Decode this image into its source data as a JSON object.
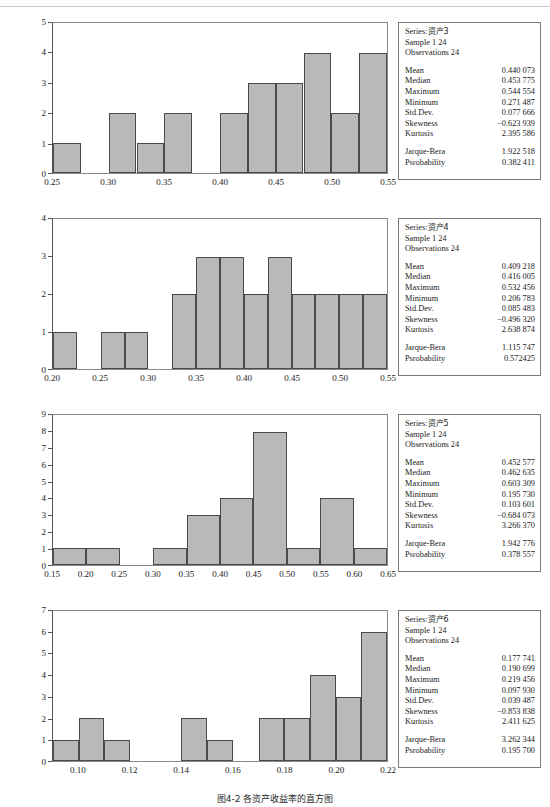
{
  "figure": {
    "caption": "图4-2  各资产收益率的直方图",
    "bar_fill": "#b9b9b9",
    "bar_stroke": "#4a4a4a",
    "frame_color": "#8a8a8a"
  },
  "stat_labels": {
    "series": "Series:",
    "sample": "Sample",
    "observations": "Observations",
    "mean": "Mean",
    "median": "Median",
    "maximum": "Maximum",
    "minimum": "Minimum",
    "std_dev": "Std.Dev.",
    "skewness": "Skewness",
    "kurtosis": "Kurtosis",
    "jarque_bera": "Jarque-Bera",
    "probability": "Psrobability"
  },
  "panels": [
    {
      "series_name": "资产3",
      "sample": "1 24",
      "observations": "24",
      "stats": {
        "mean": "0.440 073",
        "median": "0.453 775",
        "maximum": "0.544 554",
        "minimum": "0.271 487",
        "std_dev": "0.077 666",
        "skewness": "−0.623 939",
        "kurtosis": "2.395 586",
        "jarque_bera": "1.922 518",
        "probability": "0.382 411"
      },
      "chart_data": {
        "type": "bar",
        "title": "",
        "xlabel": "",
        "ylabel": "",
        "xlim": [
          0.25,
          0.55
        ],
        "ylim": [
          0,
          5
        ],
        "grid": false,
        "legend": "none",
        "xticks": [
          "0.25",
          "0.30",
          "0.35",
          "0.40",
          "0.45",
          "0.50",
          "0.55"
        ],
        "xtick_values": [
          0.25,
          0.3,
          0.35,
          0.4,
          0.45,
          0.5,
          0.55
        ],
        "yticks": [
          "0",
          "1",
          "2",
          "3",
          "4",
          "5"
        ],
        "ytick_values": [
          0,
          1,
          2,
          3,
          4,
          5
        ],
        "bin_width": 0.025,
        "bin_starts": [
          0.25,
          0.275,
          0.3,
          0.325,
          0.35,
          0.375,
          0.4,
          0.425,
          0.45,
          0.475,
          0.5,
          0.525
        ],
        "values": [
          1,
          0,
          2,
          1,
          2,
          0,
          2,
          3,
          3,
          4,
          2,
          4
        ]
      }
    },
    {
      "series_name": "资产4",
      "sample": "1 24",
      "observations": "24",
      "stats": {
        "mean": "0.409 218",
        "median": "0.416 005",
        "maximum": "0.532 456",
        "minimum": "0.206 783",
        "std_dev": "0.085 483",
        "skewness": "−0.496 320",
        "kurtosis": "2.638 874",
        "jarque_bera": "1.115 747",
        "probability": "0.572425"
      },
      "chart_data": {
        "type": "bar",
        "title": "",
        "xlabel": "",
        "ylabel": "",
        "xlim": [
          0.2,
          0.55
        ],
        "ylim": [
          0,
          4
        ],
        "grid": false,
        "legend": "none",
        "xticks": [
          "0.20",
          "0.25",
          "0.30",
          "0.35",
          "0.40",
          "0.45",
          "0.50",
          "0.55"
        ],
        "xtick_values": [
          0.2,
          0.25,
          0.3,
          0.35,
          0.4,
          0.45,
          0.5,
          0.55
        ],
        "yticks": [
          "0",
          "1",
          "2",
          "3",
          "4"
        ],
        "ytick_values": [
          0,
          1,
          2,
          3,
          4
        ],
        "bin_width": 0.025,
        "bin_starts": [
          0.2,
          0.225,
          0.25,
          0.275,
          0.3,
          0.325,
          0.35,
          0.375,
          0.4,
          0.425,
          0.45,
          0.475,
          0.5,
          0.525
        ],
        "values": [
          1,
          0,
          1,
          1,
          0,
          2,
          3,
          3,
          2,
          3,
          2,
          2,
          2,
          2
        ]
      }
    },
    {
      "series_name": "资产5",
      "sample": "1 24",
      "observations": "24",
      "stats": {
        "mean": "0.452 577",
        "median": "0.462 635",
        "maximum": "0.603 309",
        "minimum": "0.195 730",
        "std_dev": "0.103 601",
        "skewness": "−0.684 073",
        "kurtosis": "3.266 370",
        "jarque_bera": "1.942 776",
        "probability": "0.378 557"
      },
      "chart_data": {
        "type": "bar",
        "title": "",
        "xlabel": "",
        "ylabel": "",
        "xlim": [
          0.15,
          0.65
        ],
        "ylim": [
          0,
          9
        ],
        "grid": false,
        "legend": "none",
        "xticks": [
          "0.15",
          "0.20",
          "0.25",
          "0.30",
          "0.35",
          "0.40",
          "0.45",
          "0.50",
          "0.55",
          "0.60",
          "0.65"
        ],
        "xtick_values": [
          0.15,
          0.2,
          0.25,
          0.3,
          0.35,
          0.4,
          0.45,
          0.5,
          0.55,
          0.6,
          0.65
        ],
        "yticks": [
          "0",
          "1",
          "2",
          "3",
          "4",
          "5",
          "6",
          "7",
          "8",
          "9"
        ],
        "ytick_values": [
          0,
          1,
          2,
          3,
          4,
          5,
          6,
          7,
          8,
          9
        ],
        "bin_width": 0.05,
        "bin_starts": [
          0.15,
          0.2,
          0.25,
          0.3,
          0.35,
          0.4,
          0.45,
          0.5,
          0.55,
          0.6
        ],
        "values": [
          1,
          1,
          0,
          1,
          3,
          4,
          8,
          1,
          4,
          1
        ]
      }
    },
    {
      "series_name": "资产6",
      "sample": "1 24",
      "observations": "24",
      "stats": {
        "mean": "0.177 741",
        "median": "0.190 699",
        "maximum": "0.219 456",
        "minimum": "0.097 930",
        "std_dev": "0.039 487",
        "skewness": "−0.853 838",
        "kurtosis": "2.411 625",
        "jarque_bera": "3.262 344",
        "probability": "0.195 700"
      },
      "chart_data": {
        "type": "bar",
        "title": "",
        "xlabel": "",
        "ylabel": "",
        "xlim": [
          0.09,
          0.22
        ],
        "ylim": [
          0,
          7
        ],
        "grid": false,
        "legend": "none",
        "xticks": [
          "0.10",
          "0.12",
          "0.14",
          "0.16",
          "0.18",
          "0.20",
          "0.22"
        ],
        "xtick_values": [
          0.1,
          0.12,
          0.14,
          0.16,
          0.18,
          0.2,
          0.22
        ],
        "yticks": [
          "0",
          "1",
          "2",
          "3",
          "4",
          "5",
          "6",
          "7"
        ],
        "ytick_values": [
          0,
          1,
          2,
          3,
          4,
          5,
          6,
          7
        ],
        "bin_width": 0.01,
        "bin_starts": [
          0.09,
          0.1,
          0.11,
          0.12,
          0.13,
          0.14,
          0.15,
          0.16,
          0.17,
          0.18,
          0.19,
          0.2,
          0.21
        ],
        "values": [
          1,
          2,
          1,
          0,
          0,
          2,
          1,
          0,
          2,
          2,
          4,
          3,
          6
        ]
      }
    }
  ]
}
